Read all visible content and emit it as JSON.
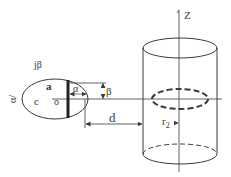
{
  "diagram": {
    "type": "physics-geometry",
    "labels": {
      "z_axis": "Z",
      "j_beta": "jβ",
      "a": "a",
      "c": "c",
      "o": "o",
      "alpha": "α",
      "alpha_prime": "α/",
      "beta": "β",
      "d": "d",
      "r2": "r",
      "r2_sub": "2"
    },
    "colors": {
      "stroke": "#3a3a3a",
      "background": "#ffffff"
    }
  }
}
